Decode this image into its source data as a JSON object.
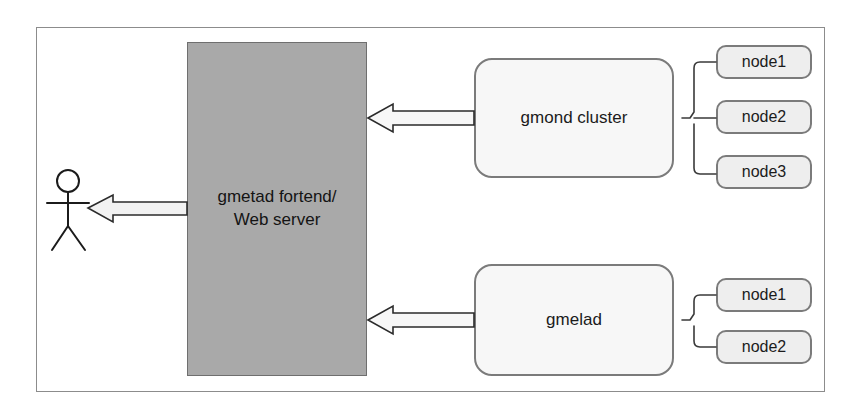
{
  "diagram": {
    "frame": {
      "border_color": "#8c8c8c"
    },
    "actor": {
      "name": "user-actor",
      "label": ""
    },
    "server": {
      "label_line1": "gmetad fortend/",
      "label_line2": "Web server",
      "fill_color": "#a9a9a9",
      "border_color": "#6f6f6f"
    },
    "groups": [
      {
        "id": "gmond-cluster",
        "label": "gmond cluster",
        "fill_color": "#f7f7f7",
        "border_color": "#7b7b7b",
        "nodes": [
          "node1",
          "node2",
          "node3"
        ]
      },
      {
        "id": "gmelad",
        "label": "gmelad",
        "fill_color": "#f7f7f7",
        "border_color": "#7b7b7b",
        "nodes": [
          "node1",
          "node2"
        ]
      }
    ],
    "arrows": [
      {
        "id": "arrow-gmond-to-server",
        "direction": "left",
        "from": "gmond cluster",
        "to": "gmetad fortend/ Web server"
      },
      {
        "id": "arrow-gmelad-to-server",
        "direction": "left",
        "from": "gmelad",
        "to": "gmetad fortend/ Web server"
      },
      {
        "id": "arrow-server-to-actor",
        "direction": "left",
        "from": "gmetad fortend/ Web server",
        "to": "user-actor"
      }
    ]
  }
}
